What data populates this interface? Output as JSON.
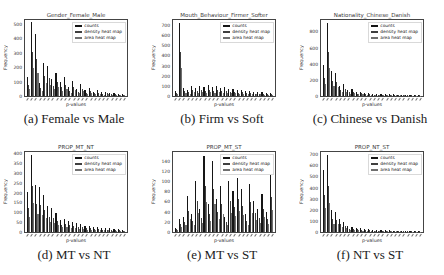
{
  "figure": {
    "legend_labels": [
      "counts",
      "density heat map",
      "area heat map"
    ],
    "series_colors": [
      "#151515",
      "#3f3f3f",
      "#6f6f6f"
    ],
    "background": "#ffffff"
  },
  "chart_data": [
    {
      "id": "a",
      "type": "bar",
      "title": "Gender_Female_Male",
      "caption": "(a) Female vs Male",
      "xlabel": "p-values",
      "ylabel": "Frequency",
      "yticks": [
        0,
        100,
        200,
        300,
        400,
        500
      ],
      "ylim": [
        0,
        520
      ],
      "grid": false,
      "legend_position": "upper right",
      "legend": [
        "counts",
        "density heat map",
        "area heat map"
      ],
      "series": [
        {
          "name": "counts",
          "values": [
            130,
            510,
            430,
            90,
            230,
            205,
            120,
            160,
            100,
            130,
            60,
            105,
            50,
            85,
            40,
            55,
            30,
            40,
            25,
            30,
            20,
            22,
            15,
            15
          ]
        },
        {
          "name": "density heat map",
          "values": [
            78,
            306,
            258,
            54,
            138,
            123,
            72,
            96,
            60,
            78,
            36,
            63,
            30,
            51,
            24,
            33,
            18,
            24,
            15,
            18,
            12,
            13,
            9,
            9
          ]
        },
        {
          "name": "area heat map",
          "values": [
            49,
            194,
            163,
            34,
            87,
            78,
            46,
            61,
            38,
            49,
            23,
            40,
            19,
            32,
            15,
            21,
            11,
            15,
            10,
            11,
            8,
            8,
            6,
            6
          ]
        }
      ]
    },
    {
      "id": "b",
      "type": "bar",
      "title": "Mouth_Behaviour_Firmer_Softer",
      "caption": "(b) Firm vs Soft",
      "xlabel": "p-values",
      "ylabel": "Frequency",
      "yticks": [
        0,
        100,
        200,
        300,
        400,
        500,
        600,
        700
      ],
      "ylim": [
        0,
        740
      ],
      "grid": false,
      "legend_position": "upper right",
      "legend": [
        "counts",
        "density heat map",
        "area heat map"
      ],
      "series": [
        {
          "name": "counts",
          "values": [
            50,
            720,
            80,
            60,
            95,
            80,
            100,
            90,
            105,
            85,
            95,
            75,
            85,
            65,
            70,
            55,
            60,
            45,
            50,
            40,
            40,
            35,
            30,
            30
          ]
        },
        {
          "name": "density heat map",
          "values": [
            30,
            430,
            48,
            36,
            57,
            48,
            60,
            54,
            63,
            51,
            57,
            45,
            51,
            39,
            42,
            33,
            36,
            27,
            30,
            24,
            24,
            21,
            18,
            18
          ]
        },
        {
          "name": "area heat map",
          "values": [
            19,
            274,
            30,
            23,
            36,
            30,
            38,
            34,
            40,
            32,
            36,
            29,
            32,
            25,
            27,
            21,
            23,
            17,
            19,
            15,
            15,
            13,
            11,
            11
          ]
        }
      ]
    },
    {
      "id": "c",
      "type": "bar",
      "title": "Nationality_Chinese_Danish",
      "caption": "(c) Chinese vs Danish",
      "xlabel": "p-values",
      "ylabel": "Frequency",
      "yticks": [
        0,
        200,
        400,
        600,
        800
      ],
      "ylim": [
        0,
        930
      ],
      "grid": false,
      "legend_position": "upper right",
      "legend": [
        "counts",
        "density heat map",
        "area heat map"
      ],
      "series": [
        {
          "name": "counts",
          "values": [
            380,
            900,
            310,
            290,
            120,
            145,
            80,
            90,
            50,
            55,
            35,
            40,
            30,
            30,
            25,
            25,
            20,
            20,
            18,
            18,
            15,
            15,
            12,
            12
          ]
        },
        {
          "name": "density heat map",
          "values": [
            228,
            540,
            186,
            174,
            72,
            87,
            48,
            54,
            30,
            33,
            21,
            24,
            18,
            18,
            15,
            15,
            12,
            12,
            11,
            11,
            9,
            9,
            7,
            7
          ]
        },
        {
          "name": "area heat map",
          "values": [
            144,
            342,
            118,
            110,
            46,
            55,
            30,
            34,
            19,
            21,
            13,
            15,
            11,
            11,
            10,
            10,
            8,
            8,
            7,
            7,
            6,
            6,
            5,
            5
          ]
        }
      ]
    },
    {
      "id": "d",
      "type": "bar",
      "title": "PROP_MT_NT",
      "caption": "(d) MT vs NT",
      "xlabel": "p-values",
      "ylabel": "Frequency",
      "yticks": [
        0,
        50,
        100,
        150,
        200,
        250,
        300,
        350,
        400
      ],
      "ylim": [
        0,
        400
      ],
      "grid": false,
      "legend_position": "upper right",
      "legend": [
        "counts",
        "density heat map",
        "area heat map"
      ],
      "series": [
        {
          "name": "counts",
          "values": [
            205,
            390,
            240,
            230,
            185,
            130,
            120,
            95,
            60,
            65,
            55,
            50,
            45,
            40,
            30,
            30,
            25,
            25,
            20,
            20,
            18,
            15,
            15,
            12
          ]
        },
        {
          "name": "density heat map",
          "values": [
            123,
            234,
            144,
            138,
            111,
            78,
            72,
            57,
            36,
            39,
            33,
            30,
            27,
            24,
            18,
            18,
            15,
            15,
            12,
            12,
            11,
            9,
            9,
            7
          ]
        },
        {
          "name": "area heat map",
          "values": [
            78,
            148,
            91,
            87,
            70,
            49,
            46,
            36,
            23,
            25,
            21,
            19,
            17,
            15,
            11,
            11,
            10,
            10,
            8,
            8,
            7,
            6,
            6,
            5
          ]
        }
      ]
    },
    {
      "id": "e",
      "type": "bar",
      "title": "PROP_MT_ST",
      "caption": "(e) MT vs ST",
      "xlabel": "p-values",
      "ylabel": "Frequency",
      "yticks": [
        0,
        20,
        40,
        60,
        80,
        100,
        120,
        140
      ],
      "ylim": [
        0,
        155
      ],
      "grid": false,
      "legend_position": "upper right",
      "legend": [
        "counts",
        "density heat map",
        "area heat map"
      ],
      "series": [
        {
          "name": "counts",
          "values": [
            8,
            25,
            30,
            70,
            35,
            100,
            45,
            150,
            55,
            140,
            65,
            90,
            30,
            100,
            80,
            105,
            85,
            35,
            95,
            60,
            45,
            75,
            40,
            112
          ]
        },
        {
          "name": "density heat map",
          "values": [
            5,
            15,
            20,
            42,
            22,
            60,
            28,
            90,
            35,
            85,
            40,
            55,
            20,
            60,
            50,
            65,
            52,
            22,
            58,
            38,
            28,
            46,
            25,
            68
          ]
        },
        {
          "name": "area heat map",
          "values": [
            3,
            10,
            13,
            26,
            14,
            38,
            18,
            58,
            22,
            55,
            26,
            35,
            13,
            38,
            32,
            42,
            33,
            14,
            37,
            24,
            18,
            30,
            16,
            44
          ]
        }
      ]
    },
    {
      "id": "f",
      "type": "bar",
      "title": "PROP_NT_ST",
      "caption": "(f) NT vs ST",
      "xlabel": "p-values",
      "ylabel": "Frequency",
      "yticks": [
        0,
        100,
        200,
        300,
        400,
        500,
        600,
        700
      ],
      "ylim": [
        0,
        710
      ],
      "grid": false,
      "legend_position": "upper right",
      "legend": [
        "counts",
        "density heat map",
        "area heat map"
      ],
      "series": [
        {
          "name": "counts",
          "values": [
            560,
            690,
            195,
            180,
            120,
            90,
            50,
            45,
            40,
            35,
            30,
            25,
            22,
            20,
            18,
            15,
            14,
            12,
            12,
            10,
            10,
            8,
            8,
            8
          ]
        },
        {
          "name": "density heat map",
          "values": [
            336,
            414,
            117,
            108,
            72,
            54,
            30,
            27,
            24,
            21,
            18,
            15,
            13,
            12,
            11,
            9,
            8,
            7,
            7,
            6,
            6,
            5,
            5,
            5
          ]
        },
        {
          "name": "area heat map",
          "values": [
            213,
            262,
            74,
            68,
            46,
            34,
            19,
            17,
            15,
            13,
            11,
            10,
            8,
            8,
            7,
            6,
            5,
            5,
            5,
            4,
            4,
            3,
            3,
            3
          ]
        }
      ]
    }
  ]
}
